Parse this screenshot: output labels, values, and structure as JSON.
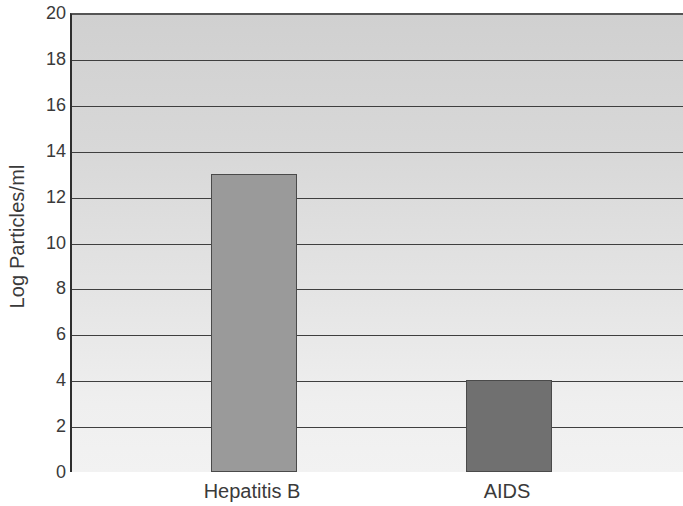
{
  "chart_data": {
    "type": "bar",
    "title": "",
    "subtitle": "",
    "xlabel": "",
    "ylabel": "Log Particles/ml",
    "categories": [
      "Hepatitis B",
      "AIDS"
    ],
    "values": [
      13,
      4
    ],
    "series": [
      {
        "name": "Log Particles/ml",
        "values": [
          13,
          4
        ]
      }
    ],
    "ylim": [
      0,
      20
    ],
    "y_ticks": [
      0,
      2,
      4,
      6,
      8,
      10,
      12,
      14,
      16,
      18,
      20
    ],
    "y_tick_labels": [
      "0",
      "2",
      "4",
      "6",
      "8",
      "10",
      "12",
      "14",
      "16",
      "18",
      "20"
    ],
    "grid": true,
    "grid_axis": "y",
    "legend": false,
    "legend_position": "none",
    "annotations": [],
    "bar_colors": [
      "#9a9a9a",
      "#707070"
    ],
    "bar_edge_color": "#4a4a4a",
    "plot_background_top": "#d0d0d0",
    "plot_background_bottom": "#f2f2f2",
    "gridline_color": "#3f3f3f",
    "axis_color": "#2a2a2a",
    "text_color": "#3a3a3a"
  },
  "axis": {
    "y_title": "Log Particles/ml"
  }
}
